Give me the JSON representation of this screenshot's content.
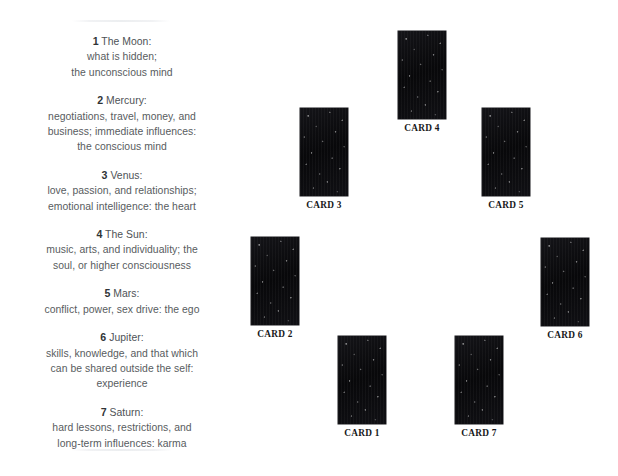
{
  "layout": {
    "background_color": "#ffffff",
    "card_color": "#0a0a0c",
    "text_color": "#585c60",
    "label_color": "#16181a",
    "divider_color": "#eceef0"
  },
  "meanings_panel": {
    "entries": [
      {
        "number": "1",
        "title": "The Moon:",
        "lines": [
          "what is hidden;",
          "the unconscious mind"
        ]
      },
      {
        "number": "2",
        "title": "Mercury:",
        "lines": [
          "negotiations, travel, money, and",
          "business; immediate influences:",
          "the conscious mind"
        ]
      },
      {
        "number": "3",
        "title": "Venus:",
        "lines": [
          "love, passion, and relationships;",
          "emotional intelligence: the heart"
        ]
      },
      {
        "number": "4",
        "title": "The Sun:",
        "lines": [
          "music, arts, and individuality; the",
          "soul, or higher consciousness"
        ]
      },
      {
        "number": "5",
        "title": "Mars:",
        "lines": [
          "conflict, power, sex drive: the ego"
        ]
      },
      {
        "number": "6",
        "title": "Jupiter:",
        "lines": [
          "skills, knowledge, and that which",
          "can be shared outside the self:",
          "experience"
        ]
      },
      {
        "number": "7",
        "title": "Saturn:",
        "lines": [
          "hard lessons, restrictions, and",
          "long-term influences: karma"
        ]
      }
    ]
  },
  "spread": {
    "cards": [
      {
        "label": "CARD 4",
        "x": 168,
        "y": 31
      },
      {
        "label": "CARD 3",
        "x": 70,
        "y": 108
      },
      {
        "label": "CARD 5",
        "x": 252,
        "y": 108
      },
      {
        "label": "CARD 2",
        "x": 21,
        "y": 237
      },
      {
        "label": "CARD 6",
        "x": 311,
        "y": 238
      },
      {
        "label": "CARD 1",
        "x": 108,
        "y": 336
      },
      {
        "label": "CARD 7",
        "x": 225,
        "y": 336
      }
    ]
  }
}
